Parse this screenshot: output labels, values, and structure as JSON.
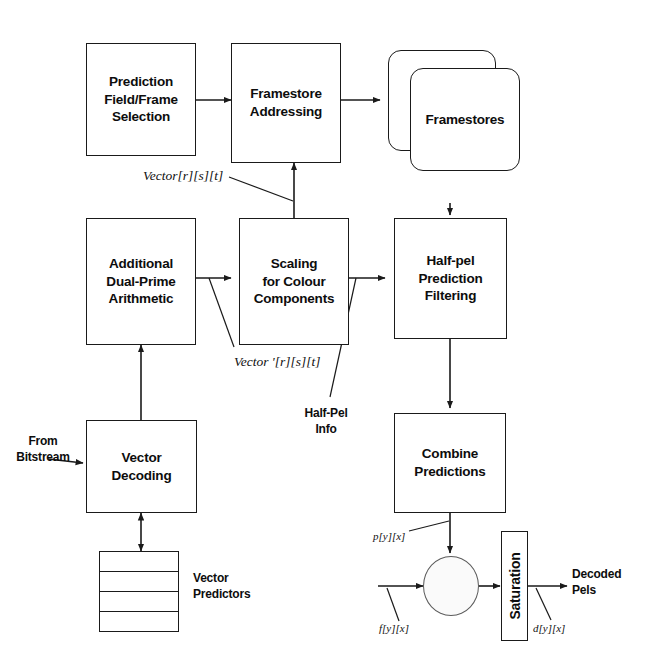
{
  "diagram": {
    "stroke_color": "#1a1a1a",
    "background_color": "#ffffff",
    "blocks": [
      {
        "id": "prediction_field_frame_selection",
        "label": "Prediction\nField/Frame\nSelection"
      },
      {
        "id": "framestore_addressing",
        "label": "Framestore\nAddressing"
      },
      {
        "id": "framestores",
        "label": "Framestores"
      },
      {
        "id": "additional_dual_prime_arithmetic",
        "label": "Additional\nDual-Prime\nArithmetic"
      },
      {
        "id": "scaling_for_colour_components",
        "label": "Scaling\nfor Colour\nComponents"
      },
      {
        "id": "half_pel_prediction_filtering",
        "label": "Half-pel\nPrediction\nFiltering"
      },
      {
        "id": "vector_decoding",
        "label": "Vector\nDecoding"
      },
      {
        "id": "combine_predictions",
        "label": "Combine\nPredictions"
      },
      {
        "id": "saturation",
        "label": "Saturation"
      },
      {
        "id": "vector_predictors",
        "label": "Vector\nPredictors",
        "rows": 4
      }
    ],
    "annotations": {
      "from_bitstream": "From\nBitstream",
      "vector_predictors": "Vector\nPredictors",
      "half_pel_info": "Half-Pel\nInfo",
      "decoded_pels": "Decoded\nPels",
      "vector_rst": "Vector[r][s][t]",
      "vector_prime_rst": "Vector '[r][s][t]",
      "p_yx": "p[y][x]",
      "f_yx": "f[y][x]",
      "d_yx": "d[y][x]"
    }
  }
}
